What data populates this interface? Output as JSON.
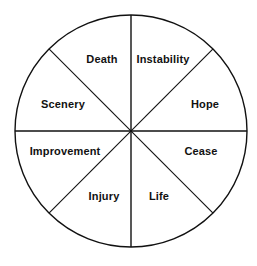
{
  "diagram": {
    "shape": "circle",
    "background_color": "#ffffff",
    "stroke_color": "#111111",
    "label_color": "#111111",
    "center": {
      "x": 131,
      "y": 131
    },
    "radius": 116,
    "sector_count": 8,
    "divider_lines": [
      {
        "name": "vertical-divider",
        "angle_deg": 90
      },
      {
        "name": "horizontal-divider",
        "angle_deg": 0
      },
      {
        "name": "diagonal-divider-nw-se",
        "angle_deg": 135
      },
      {
        "name": "diagonal-divider-ne-sw",
        "angle_deg": 45
      }
    ],
    "sectors": [
      {
        "id": "death",
        "label": "Death",
        "position": "upper-left-inner",
        "x": 102,
        "y": 59,
        "angle_range_deg": [
          90,
          135
        ]
      },
      {
        "id": "instability",
        "label": "Instability",
        "position": "upper-right-inner",
        "x": 163,
        "y": 59,
        "angle_range_deg": [
          45,
          90
        ]
      },
      {
        "id": "scenery",
        "label": "Scenery",
        "position": "left-upper",
        "x": 63,
        "y": 104,
        "angle_range_deg": [
          135,
          180
        ]
      },
      {
        "id": "hope",
        "label": "Hope",
        "position": "right-upper",
        "x": 205,
        "y": 104,
        "angle_range_deg": [
          0,
          45
        ]
      },
      {
        "id": "improvement",
        "label": "Improvement",
        "position": "left-lower",
        "x": 65,
        "y": 151,
        "angle_range_deg": [
          180,
          225
        ]
      },
      {
        "id": "cease",
        "label": "Cease",
        "position": "right-lower",
        "x": 201,
        "y": 151,
        "angle_range_deg": [
          315,
          360
        ]
      },
      {
        "id": "injury",
        "label": "Injury",
        "position": "lower-left-inner",
        "x": 104,
        "y": 196,
        "angle_range_deg": [
          225,
          270
        ]
      },
      {
        "id": "life",
        "label": "Life",
        "position": "lower-right-inner",
        "x": 159,
        "y": 196,
        "angle_range_deg": [
          270,
          315
        ]
      }
    ]
  }
}
